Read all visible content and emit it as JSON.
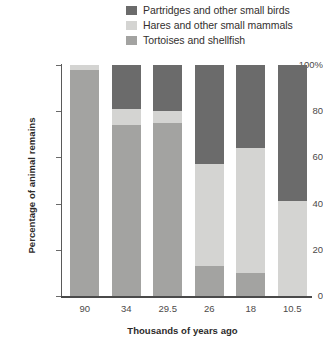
{
  "legend": {
    "position": "top-right",
    "items": [
      {
        "label": "Partridges and other small birds",
        "color": "#6b6b6b",
        "key": "partridges"
      },
      {
        "label": "Hares and other small mammals",
        "color": "#d4d4d2",
        "key": "hares"
      },
      {
        "label": "Tortoises and shellfish",
        "color": "#a3a3a1",
        "key": "tortoises"
      }
    ]
  },
  "axes": {
    "ylabel": "Percentage of animal remains",
    "xlabel": "Thousands of years ago",
    "yticks": [
      "0",
      "20",
      "40",
      "60",
      "80",
      "100%"
    ],
    "ytick_values": [
      0,
      20,
      40,
      60,
      80,
      100
    ]
  },
  "chart_data": {
    "type": "bar",
    "stacked": true,
    "title": "",
    "xlabel": "Thousands of years ago",
    "ylabel": "Percentage of animal remains",
    "ylim": [
      0,
      100
    ],
    "yticks": [
      0,
      20,
      40,
      60,
      80,
      100
    ],
    "grid": false,
    "legend_position": "top-right",
    "categories": [
      "90",
      "34",
      "29.5",
      "26",
      "18",
      "10.5"
    ],
    "series": [
      {
        "name": "Tortoises and shellfish",
        "color": "#a3a3a1",
        "values": [
          98,
          74,
          75,
          13,
          10,
          0
        ]
      },
      {
        "name": "Hares and other small mammals",
        "color": "#d4d4d2",
        "values": [
          2,
          7,
          5,
          44,
          54,
          41
        ]
      },
      {
        "name": "Partridges and other small birds",
        "color": "#6b6b6b",
        "values": [
          0,
          19,
          20,
          43,
          36,
          59
        ]
      }
    ]
  }
}
